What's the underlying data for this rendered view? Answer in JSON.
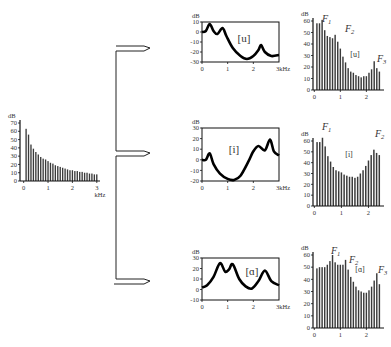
{
  "source_spectrum": {
    "y_unit": "dB",
    "x_unit": "kHz",
    "y_ticks": [
      "0",
      "10",
      "20",
      "30",
      "40",
      "50",
      "60",
      "70"
    ],
    "x_ticks": [
      "0",
      "1",
      "2",
      "3"
    ]
  },
  "filters": [
    {
      "vowel": "[u]",
      "y_unit": "dB",
      "x_unit": "3kHz",
      "y_ticks": [
        "10",
        "0",
        "-10",
        "-20",
        "-30"
      ],
      "x_ticks": [
        "0",
        "1",
        "2"
      ]
    },
    {
      "vowel": "[i]",
      "y_unit": "dB",
      "x_unit": "3kHz",
      "y_ticks": [
        "30",
        "20",
        "10",
        "0",
        "-10",
        "-20"
      ],
      "x_ticks": [
        "0",
        "1",
        "2"
      ]
    },
    {
      "vowel": "[ɑ]",
      "y_unit": "dB",
      "x_unit": "3kHz",
      "y_ticks": [
        "30",
        "20",
        "10",
        "0",
        "-10"
      ],
      "x_ticks": [
        "0",
        "1",
        "2"
      ]
    }
  ],
  "outputs": [
    {
      "vowel": "[u]",
      "y_unit": "dB",
      "y_ticks": [
        "0",
        "10",
        "20",
        "30",
        "40",
        "50",
        "60"
      ],
      "x_ticks": [
        "0",
        "1",
        "2"
      ],
      "formants": [
        "F1",
        "F2",
        "F3"
      ]
    },
    {
      "vowel": "[i]",
      "y_unit": "dB",
      "y_ticks": [
        "0",
        "10",
        "20",
        "30",
        "40",
        "50",
        "60"
      ],
      "x_ticks": [
        "0",
        "1",
        "2"
      ],
      "formants": [
        "F1",
        "F2"
      ]
    },
    {
      "vowel": "[ɑ]",
      "y_unit": "dB",
      "y_ticks": [
        "0",
        "10",
        "20",
        "30",
        "40",
        "50",
        "60"
      ],
      "x_ticks": [
        "0",
        "1",
        "2"
      ],
      "formants": [
        "F1",
        "F2",
        "F3"
      ]
    }
  ],
  "chart_data": [
    {
      "type": "bar",
      "title": "Glottal source spectrum",
      "xlabel": "kHz",
      "ylabel": "dB",
      "ylim": [
        0,
        70
      ],
      "xlim": [
        0,
        3
      ],
      "x": [
        0.1,
        0.2,
        0.3,
        0.4,
        0.5,
        0.6,
        0.7,
        0.8,
        0.9,
        1.0,
        1.1,
        1.2,
        1.3,
        1.4,
        1.5,
        1.6,
        1.7,
        1.8,
        1.9,
        2.0,
        2.1,
        2.2,
        2.3,
        2.4,
        2.5,
        2.6,
        2.7,
        2.8,
        2.9,
        3.0
      ],
      "values": [
        63,
        56,
        44,
        39,
        35,
        32,
        29,
        27,
        26,
        24,
        22,
        21,
        19,
        18,
        17,
        16,
        15,
        14,
        13,
        13,
        12,
        12,
        11,
        11,
        10,
        10,
        9,
        9,
        8,
        8
      ]
    },
    {
      "type": "line",
      "title": "Vocal tract filter [u]",
      "xlabel": "kHz",
      "ylabel": "dB",
      "ylim": [
        -30,
        10
      ],
      "xlim": [
        0,
        3
      ],
      "x": [
        0,
        0.15,
        0.3,
        0.45,
        0.6,
        0.8,
        0.95,
        1.2,
        1.5,
        1.75,
        2.0,
        2.2,
        2.3,
        2.45,
        2.7,
        3.0
      ],
      "values": [
        0,
        1,
        8,
        1,
        -2,
        4,
        -4,
        -16,
        -24,
        -27,
        -24,
        -18,
        -13,
        -20,
        -24,
        -23
      ]
    },
    {
      "type": "line",
      "title": "Vocal tract filter [i]",
      "xlabel": "kHz",
      "ylabel": "dB",
      "ylim": [
        -20,
        30
      ],
      "xlim": [
        0,
        3
      ],
      "x": [
        0,
        0.15,
        0.3,
        0.45,
        0.7,
        1.0,
        1.25,
        1.5,
        1.8,
        2.0,
        2.2,
        2.45,
        2.65,
        2.8,
        3.0
      ],
      "values": [
        0,
        0,
        6,
        -4,
        -13,
        -18,
        -19,
        -15,
        -2,
        8,
        13,
        9,
        19,
        8,
        4
      ]
    },
    {
      "type": "line",
      "title": "Vocal tract filter [ɑ]",
      "xlabel": "kHz",
      "ylabel": "dB",
      "ylim": [
        -10,
        30
      ],
      "xlim": [
        0,
        3
      ],
      "x": [
        0,
        0.2,
        0.45,
        0.7,
        0.9,
        1.05,
        1.2,
        1.45,
        1.7,
        1.95,
        2.2,
        2.45,
        2.7,
        3.0
      ],
      "values": [
        2,
        4,
        12,
        25,
        17,
        19,
        24,
        10,
        3,
        1,
        8,
        18,
        8,
        4
      ]
    },
    {
      "type": "bar",
      "title": "Output spectrum [u]",
      "xlabel": "kHz",
      "ylabel": "dB",
      "ylim": [
        0,
        60
      ],
      "x": [
        0.1,
        0.2,
        0.3,
        0.4,
        0.5,
        0.6,
        0.7,
        0.8,
        0.9,
        1.0,
        1.1,
        1.2,
        1.3,
        1.4,
        1.5,
        1.6,
        1.7,
        1.8,
        1.9,
        2.0,
        2.1,
        2.2,
        2.3,
        2.4,
        2.5
      ],
      "values": [
        58,
        58,
        61,
        52,
        47,
        46,
        45,
        48,
        42,
        36,
        29,
        24,
        19,
        16,
        15,
        13,
        12,
        11,
        12,
        12,
        15,
        18,
        25,
        19,
        16
      ],
      "annotations": [
        "F1",
        "F2",
        "F3",
        "[u]"
      ]
    },
    {
      "type": "bar",
      "title": "Output spectrum [i]",
      "xlabel": "kHz",
      "ylabel": "dB",
      "ylim": [
        0,
        60
      ],
      "x": [
        0.1,
        0.2,
        0.3,
        0.4,
        0.5,
        0.6,
        0.7,
        0.8,
        0.9,
        1.0,
        1.1,
        1.2,
        1.3,
        1.4,
        1.5,
        1.6,
        1.7,
        1.8,
        1.9,
        2.0,
        2.1,
        2.2,
        2.3,
        2.4
      ],
      "values": [
        59,
        59,
        63,
        55,
        46,
        41,
        36,
        33,
        32,
        31,
        29,
        28,
        27,
        27,
        26,
        27,
        30,
        33,
        37,
        42,
        47,
        52,
        49,
        47
      ],
      "annotations": [
        "F1",
        "F2",
        "[i]"
      ]
    },
    {
      "type": "bar",
      "title": "Output spectrum [ɑ]",
      "xlabel": "kHz",
      "ylabel": "dB",
      "ylim": [
        0,
        60
      ],
      "x": [
        0.1,
        0.2,
        0.3,
        0.4,
        0.5,
        0.6,
        0.7,
        0.8,
        0.9,
        1.0,
        1.1,
        1.2,
        1.3,
        1.4,
        1.5,
        1.6,
        1.7,
        1.8,
        1.9,
        2.0,
        2.1,
        2.2,
        2.3,
        2.4,
        2.5
      ],
      "values": [
        49,
        50,
        50,
        50,
        52,
        55,
        60,
        54,
        52,
        52,
        52,
        56,
        48,
        42,
        38,
        34,
        31,
        30,
        29,
        29,
        31,
        34,
        39,
        45,
        36
      ],
      "annotations": [
        "F1",
        "F2",
        "F3",
        "[ɑ]"
      ]
    }
  ]
}
